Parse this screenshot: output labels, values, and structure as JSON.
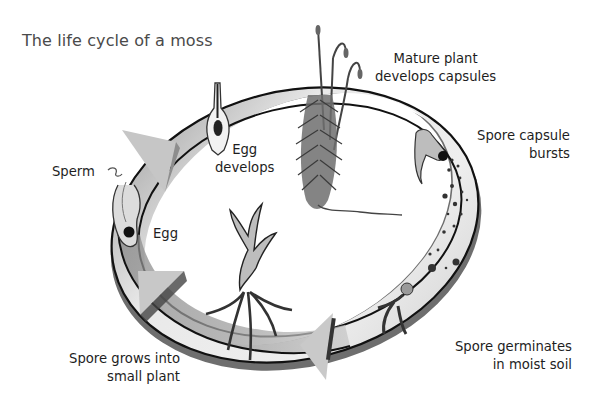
{
  "title": "The life cycle of a moss",
  "stages": {
    "mature_plant": {
      "line1": "Mature plant",
      "line2": "develops capsules"
    },
    "capsule_bursts": {
      "line1": "Spore capsule",
      "line2": "bursts"
    },
    "spore_germinates": {
      "line1": "Spore germinates",
      "line2": "in moist soil"
    },
    "spore_grows": {
      "line1": "Spore grows into",
      "line2": "small plant"
    },
    "egg": {
      "label": "Egg"
    },
    "sperm": {
      "label": "Sperm"
    },
    "egg_develops": {
      "line1": "Egg",
      "line2": "develops"
    }
  },
  "colors": {
    "ring_light": "#e6e6e6",
    "ring_dark": "#8a8a8a",
    "ring_outline": "#111111",
    "arrow": "#c9c9c9",
    "text": "#1e1e1e"
  },
  "arrows": [
    "upper-left clockwise arrow",
    "lower-left upward arrow",
    "bottom leftward arrow"
  ]
}
